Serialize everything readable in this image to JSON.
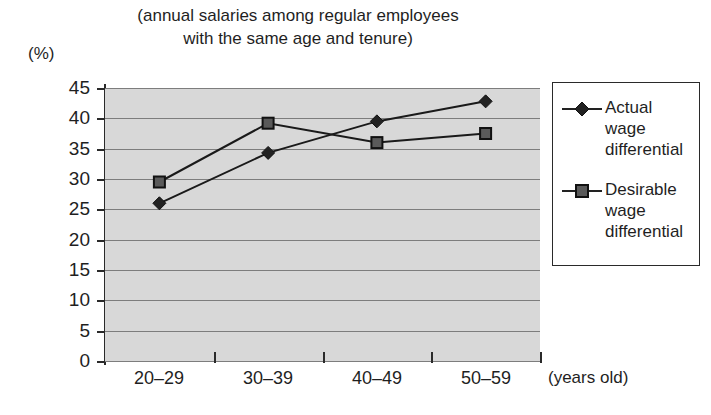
{
  "chart_data": {
    "type": "line",
    "title": "(annual salaries among regular employees\nwith the same age and tenure)",
    "xlabel": "(years old)",
    "ylabel": "(%)",
    "categories": [
      "20–29",
      "30–39",
      "40–49",
      "50–59"
    ],
    "series": [
      {
        "name": "Actual\nwage\ndifferential",
        "name_flat": "Actual wage differential",
        "marker": "diamond",
        "color": "#222222",
        "values": [
          26.0,
          34.3,
          39.5,
          42.8
        ]
      },
      {
        "name": "Desirable\nwage\ndifferential",
        "name_flat": "Desirable wage differential",
        "marker": "square",
        "color": "#5a5a5a",
        "values": [
          29.5,
          39.2,
          36.0,
          37.5
        ]
      }
    ],
    "ylim": [
      0,
      45
    ],
    "ytick_step": 5,
    "yticks": [
      "45",
      "40",
      "35",
      "30",
      "25",
      "20",
      "15",
      "10",
      "5",
      "0"
    ],
    "grid": true,
    "legend_position": "right",
    "plot_background": "#d8d8d8",
    "gridline_color": "#7d7d7d"
  }
}
